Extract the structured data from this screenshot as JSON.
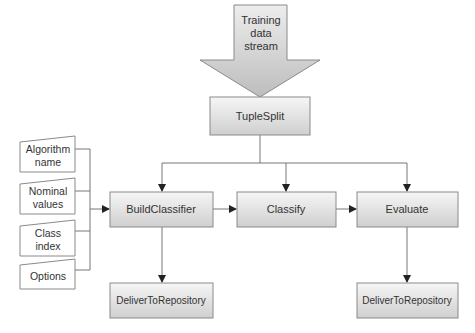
{
  "diagram": {
    "input_arrow": {
      "lines": [
        "Training",
        "data",
        "stream"
      ]
    },
    "nodes": {
      "tuple_split": "TupleSplit",
      "build_classifier": "BuildClassifier",
      "classify": "Classify",
      "evaluate": "Evaluate",
      "deliver_left": "DeliverToRepository",
      "deliver_right": "DeliverToRepository"
    },
    "inputs": [
      {
        "lines": [
          "Algorithm",
          "name"
        ]
      },
      {
        "lines": [
          "Nominal",
          "values"
        ]
      },
      {
        "lines": [
          "Class",
          "index"
        ]
      },
      {
        "lines": [
          "Options"
        ]
      }
    ],
    "colors": {
      "box_top": "#f4f4f4",
      "box_bottom": "#d2d2d2",
      "stroke": "#8a8a8a",
      "line": "#777777"
    }
  }
}
